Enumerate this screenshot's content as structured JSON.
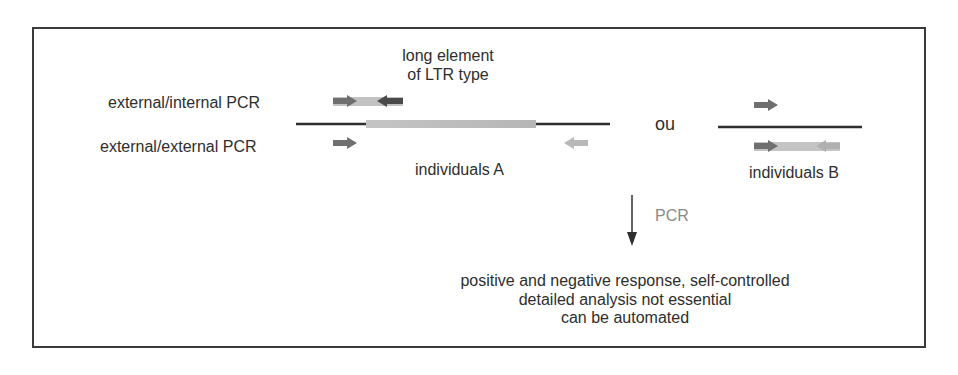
{
  "diagram": {
    "element_label_line1": "long element",
    "element_label_line2": "of LTR type",
    "row_labels": {
      "external_internal": "external/internal PCR",
      "external_external": "external/external PCR"
    },
    "separator": "ou",
    "individuals_a": "individuals A",
    "individuals_b": "individuals B",
    "process_label": "PCR",
    "result_lines": [
      "positive and negative response, self-controlled",
      "detailed analysis not essential",
      "can be automated"
    ],
    "colors": {
      "dna_line": "#2e2e2e",
      "ltr_element": "#bdbdbd",
      "primer_dark": "#6f6f6f",
      "primer_light": "#b8b8b8",
      "frame": "#3a3a3a",
      "pcr_label": "#8a8a8a"
    }
  }
}
